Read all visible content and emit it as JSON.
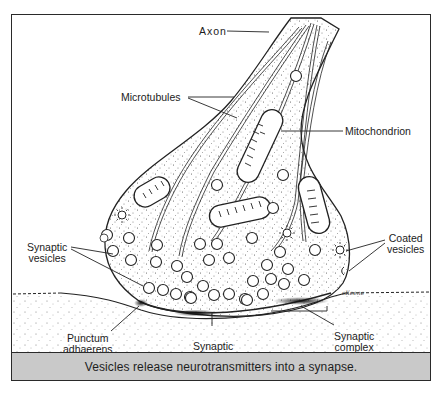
{
  "figure": {
    "caption": "Vesicles release neurotransmitters into a synapse.",
    "signature": "cKeene",
    "labels": {
      "axon": "Axon",
      "microtubules": "Microtubules",
      "mitochondrion": "Mitochondrion",
      "synaptic_vesicles_line1": "Synaptic",
      "synaptic_vesicles_line2": "vesicles",
      "coated_vesicles_line1": "Coated",
      "coated_vesicles_line2": "vesicles",
      "punctum_adhaerens_line1": "Punctum",
      "punctum_adhaerens_line2": "adhaerens",
      "synaptic_cleft_line1": "Synaptic",
      "synaptic_cleft_line2": "cleft",
      "synaptic_complex_line1": "Synaptic",
      "synaptic_complex_line2": "complex"
    },
    "colors": {
      "line": "#222222",
      "caption_bg": "#c9c9c9",
      "stipple": "#555555"
    }
  }
}
